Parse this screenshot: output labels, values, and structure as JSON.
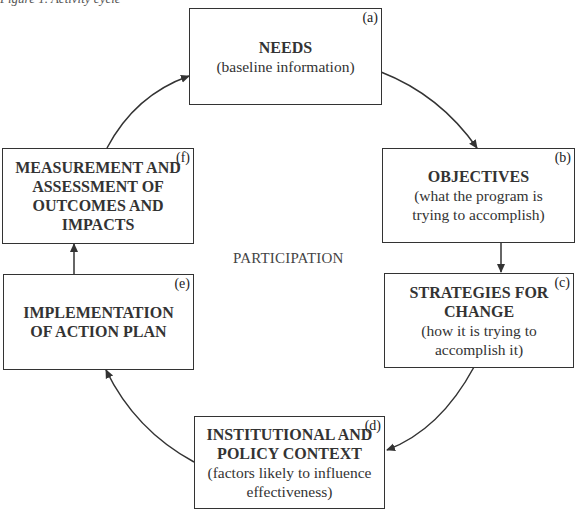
{
  "caption": "Figure 1. Activity cycle",
  "center_label": "PARTICIPATION",
  "boxes": {
    "a": {
      "tag": "(a)",
      "title": [
        "NEEDS"
      ],
      "sub": [
        "(baseline information)"
      ]
    },
    "b": {
      "tag": "(b)",
      "title": [
        "OBJECTIVES"
      ],
      "sub": [
        "(what the program is",
        "trying to accomplish)"
      ]
    },
    "c": {
      "tag": "(c)",
      "title": [
        "STRATEGIES FOR",
        "CHANGE"
      ],
      "sub": [
        "(how it is trying to",
        "accomplish it)"
      ]
    },
    "d": {
      "tag": "(d)",
      "title": [
        "INSTITUTIONAL AND",
        "POLICY CONTEXT"
      ],
      "sub": [
        "(factors likely to influence",
        "effectiveness)"
      ]
    },
    "e": {
      "tag": "(e)",
      "title": [
        "IMPLEMENTATION",
        "OF ACTION PLAN"
      ],
      "sub": []
    },
    "f": {
      "tag": "(f)",
      "title": [
        "MEASUREMENT AND",
        "ASSESSMENT OF",
        "OUTCOMES AND",
        "IMPACTS"
      ],
      "sub": []
    }
  },
  "flow": [
    "a",
    "b",
    "c",
    "d",
    "e",
    "f",
    "a"
  ],
  "colors": {
    "stroke": "#333333",
    "text": "#2b2b2b",
    "background": "#ffffff"
  }
}
